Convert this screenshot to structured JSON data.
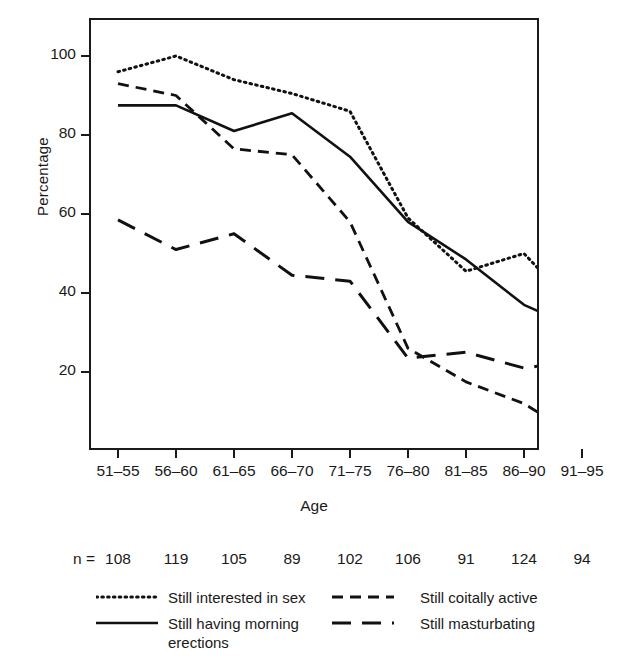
{
  "chart_data": {
    "type": "line",
    "title": "",
    "xlabel": "Age",
    "ylabel": "Percentage",
    "categories": [
      "51–55",
      "56–60",
      "61–65",
      "66–70",
      "71–75",
      "76–80",
      "81–85",
      "86–90",
      "91–95"
    ],
    "yticks": [
      20,
      40,
      60,
      80,
      100
    ],
    "ylim": [
      0,
      108
    ],
    "grid": false,
    "legend_position": "below-plot",
    "sample_sizes_label": "n =",
    "sample_sizes": [
      108,
      119,
      105,
      89,
      102,
      106,
      91,
      124,
      94
    ],
    "series": [
      {
        "name": "Still interested in sex",
        "style": "dotted",
        "color": "#111111",
        "values": [
          96,
          100,
          94,
          90.5,
          86,
          59,
          45.5,
          50,
          34.5
        ]
      },
      {
        "name": "Still having morning\nerections",
        "style": "solid",
        "color": "#111111",
        "values": [
          87.5,
          87.5,
          81,
          85.5,
          74.5,
          58,
          48.5,
          37,
          30.5
        ]
      },
      {
        "name": "Still coitally active",
        "style": "short-dash",
        "color": "#111111",
        "values": [
          93,
          90,
          76.5,
          75,
          58,
          26,
          17.5,
          12,
          3
        ]
      },
      {
        "name": "Still masturbating",
        "style": "long-dash",
        "color": "#111111",
        "values": [
          58.5,
          51,
          55,
          44.5,
          43,
          23.5,
          25,
          21,
          23
        ]
      }
    ]
  },
  "axis": {
    "y_title": "Percentage",
    "x_title": "Age",
    "ytick_labels": [
      "20",
      "40",
      "60",
      "80",
      "100"
    ],
    "xtick_labels": [
      "51–55",
      "56–60",
      "61–65",
      "66–70",
      "71–75",
      "76–80",
      "81–85",
      "86–90",
      "91–95"
    ]
  },
  "n_row": {
    "prefix": "n =",
    "values": [
      "108",
      "119",
      "105",
      "89",
      "102",
      "106",
      "91",
      "124",
      "94"
    ]
  },
  "legend": {
    "items": [
      {
        "label": "Still interested in sex",
        "style": "dotted"
      },
      {
        "label": "Still having morning\nerections",
        "style": "solid"
      },
      {
        "label": "Still coitally active",
        "style": "short-dash"
      },
      {
        "label": "Still masturbating",
        "style": "long-dash"
      }
    ]
  }
}
